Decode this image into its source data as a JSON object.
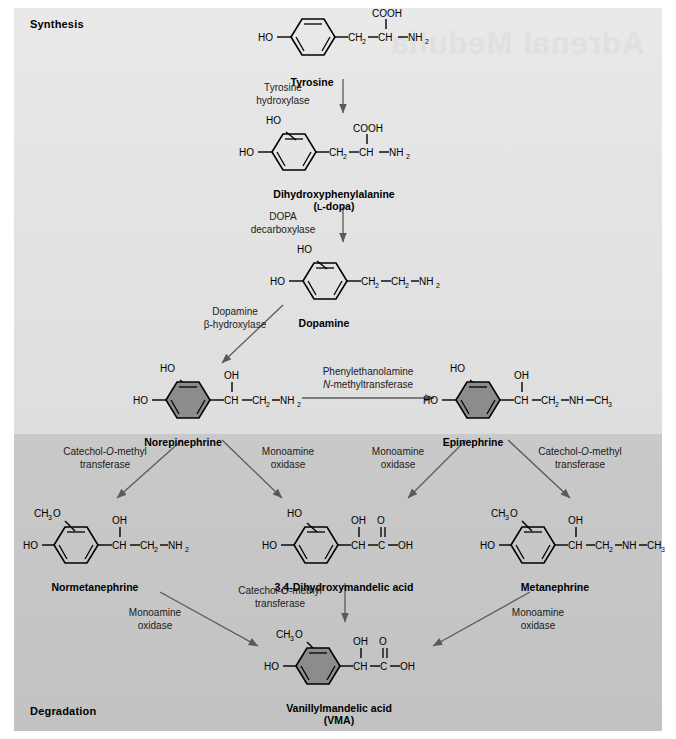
{
  "figure": {
    "title_top": "Synthesis",
    "title_bottom": "Degradation",
    "ghost_text": "Adrenal Medulla",
    "colors": {
      "band_synthesis": "#e4e4e4",
      "band_degradation": "#c6c6c6",
      "ring_shaded": "#8c8c8c",
      "ink": "#000000",
      "arrow": "#555555"
    }
  },
  "molecules": {
    "tyrosine": {
      "name": "Tyrosine",
      "ring": "open",
      "substituents": {
        "ring_left": "HO",
        "chain": "CH2 — CH — NH2",
        "top": "COOH"
      },
      "atoms": {
        "ho": "HO",
        "ch2": "CH",
        "ch2_sub": "2",
        "ch": "CH",
        "nh2": "NH",
        "nh2_sub": "2",
        "cooh": "COOH"
      }
    },
    "ldopa": {
      "name": "Dihydroxyphenylalanine",
      "name2": "(L-dopa)",
      "name2_smallcap": "L",
      "ring": "open",
      "atoms": {
        "ho_top": "HO",
        "ho_left": "HO",
        "ch2": "CH",
        "ch2_sub": "2",
        "ch": "CH",
        "nh2": "NH",
        "nh2_sub": "2",
        "cooh": "COOH"
      }
    },
    "dopamine": {
      "name": "Dopamine",
      "ring": "open",
      "atoms": {
        "ho_top": "HO",
        "ho_left": "HO",
        "ch2a": "CH",
        "ch2a_sub": "2",
        "ch2b": "CH",
        "ch2b_sub": "2",
        "nh2": "NH",
        "nh2_sub": "2"
      }
    },
    "norepinephrine": {
      "name": "Norepinephrine",
      "ring": "shaded",
      "atoms": {
        "ho_top": "HO",
        "ho_left": "HO",
        "oh": "OH",
        "ch": "CH",
        "ch2": "CH",
        "ch2_sub": "2",
        "nh2": "NH",
        "nh2_sub": "2"
      }
    },
    "epinephrine": {
      "name": "Epinephrine",
      "ring": "shaded",
      "atoms": {
        "ho_top": "HO",
        "ho_left": "HO",
        "oh": "OH",
        "ch": "CH",
        "ch2": "CH",
        "ch2_sub": "2",
        "nh": "NH",
        "ch3": "CH",
        "ch3_sub": "3"
      }
    },
    "normetanephrine": {
      "name": "Normetanephrine",
      "ring": "open",
      "atoms": {
        "ch3o": "CH",
        "ch3o_sub": "3",
        "ch3o_end": "O",
        "ho_left": "HO",
        "oh": "OH",
        "ch": "CH",
        "ch2": "CH",
        "ch2_sub": "2",
        "nh2": "NH",
        "nh2_sub": "2"
      }
    },
    "dhma": {
      "name": "3,4-Dihydroxymandelic acid",
      "ring": "open",
      "atoms": {
        "ho_top": "HO",
        "ho_left": "HO",
        "oh_top": "OH",
        "o_top": "O",
        "ch": "CH",
        "c": "C",
        "oh_end": "OH"
      }
    },
    "metanephrine": {
      "name": "Metanephrine",
      "ring": "open",
      "atoms": {
        "ch3o": "CH",
        "ch3o_sub": "3",
        "ch3o_end": "O",
        "ho_left": "HO",
        "oh": "OH",
        "ch": "CH",
        "ch2": "CH",
        "ch2_sub": "2",
        "nh": "NH",
        "ch3": "CH",
        "ch3_sub": "3"
      }
    },
    "vma": {
      "name": "Vanillylmandelic acid",
      "name2": "(VMA)",
      "ring": "shaded",
      "atoms": {
        "ch3o": "CH",
        "ch3o_sub": "3",
        "ch3o_end": "O",
        "ho_left": "HO",
        "oh_top": "OH",
        "o_top": "O",
        "ch": "CH",
        "c": "C",
        "oh_end": "OH"
      }
    }
  },
  "enzymes": {
    "tyrosine_hydroxylase": {
      "line1": "Tyrosine",
      "line2": "hydroxylase"
    },
    "dopa_decarboxylase": {
      "line1": "DOPA",
      "line2": "decarboxylase"
    },
    "dopamine_beta_hydroxylase": {
      "line1": "Dopamine",
      "line2": "β-hydroxylase"
    },
    "pnmt": {
      "line1": "Phenylethanolamine",
      "line2_italic": "N",
      "line2_rest": "-methyltransferase"
    },
    "comt_ne_left": {
      "line1_a": "Catechol-",
      "line1_italic": "O",
      "line1_b": "-methyl",
      "line2": "transferase"
    },
    "mao_ne": {
      "line1": "Monoamine",
      "line2": "oxidase"
    },
    "mao_epi": {
      "line1": "Monoamine",
      "line2": "oxidase"
    },
    "comt_epi_right": {
      "line1_a": "Catechol-",
      "line1_italic": "O",
      "line1_b": "-methyl",
      "line2": "transferase"
    },
    "mao_nmn": {
      "line1": "Monoamine",
      "line2": "oxidase"
    },
    "comt_dhma": {
      "line1_a": "Catechol-",
      "line1_italic": "O",
      "line1_b": "-methyl",
      "line2": "transferase"
    },
    "mao_mn": {
      "line1": "Monoamine",
      "line2": "oxidase"
    }
  }
}
